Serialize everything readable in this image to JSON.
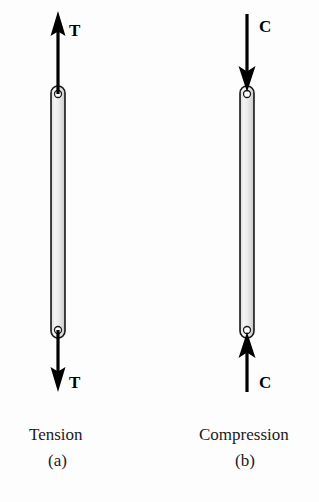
{
  "figure": {
    "background_color": "#fdfdfd",
    "ink_color": "#000000",
    "bar_fill_light": "#f2f2f2",
    "bar_fill_mid": "#d9d9d9",
    "bar_edge_color": "#1a1a1a",
    "hole_fill": "#ffffff",
    "panels": [
      {
        "id": "tension",
        "caption_name": "Tension",
        "caption_index": "(a)",
        "force_symbol_top": "T",
        "force_symbol_bottom": "T",
        "top_arrow_direction": "up",
        "bottom_arrow_direction": "down",
        "bar_center_x": 58,
        "bar_top_y": 86,
        "bar_bottom_y": 338,
        "bar_width": 14,
        "top_arrow_tip_y": 12,
        "bottom_arrow_tip_y": 391,
        "caption_name_x": 29,
        "caption_name_y": 428,
        "caption_index_x": 47,
        "caption_index_y": 453,
        "label_top_x": 69,
        "label_top_y": 22,
        "label_bottom_x": 69,
        "label_bottom_y": 376
      },
      {
        "id": "compression",
        "caption_name": "Compression",
        "caption_index": "(b)",
        "force_symbol_top": "C",
        "force_symbol_bottom": "C",
        "top_arrow_direction": "down",
        "bottom_arrow_direction": "up",
        "bar_center_x": 247,
        "bar_top_y": 86,
        "bar_bottom_y": 338,
        "bar_width": 14,
        "top_arrow_tip_y": 12,
        "bottom_arrow_tip_y": 391,
        "caption_name_x": 199,
        "caption_name_y": 428,
        "caption_index_x": 234,
        "caption_index_y": 453,
        "label_top_x": 259,
        "label_top_y": 19,
        "label_bottom_x": 259,
        "label_bottom_y": 376
      }
    ]
  }
}
